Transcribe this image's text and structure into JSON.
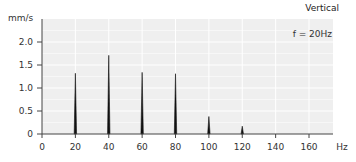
{
  "chart_data": {
    "type": "bar",
    "subtype": "spectrum-spikes",
    "title": "Vertical",
    "annotation": "f = 20Hz",
    "xlabel": "Hz",
    "ylabel": "mm/s",
    "x": [
      20,
      40,
      60,
      80,
      100,
      120
    ],
    "values": [
      1.32,
      1.71,
      1.34,
      1.31,
      0.38,
      0.17
    ],
    "xlim": [
      0,
      175
    ],
    "ylim": [
      0,
      2.45
    ],
    "xticks": [
      0,
      20,
      40,
      60,
      80,
      100,
      120,
      140,
      160
    ],
    "xtick_labels": [
      "0",
      "20",
      "40",
      "60",
      "80",
      "100",
      "120",
      "140",
      "160"
    ],
    "yticks": [
      0,
      0.5,
      1.0,
      1.5,
      2.0
    ],
    "ytick_labels": [
      "0",
      "0.5",
      "1.0",
      "1.5",
      "2.0"
    ],
    "grid": true,
    "legend": null,
    "colors": {
      "plot_background": "#efefef",
      "grid": "#ffffff",
      "axis": "#444444",
      "spike": "#111111"
    }
  }
}
